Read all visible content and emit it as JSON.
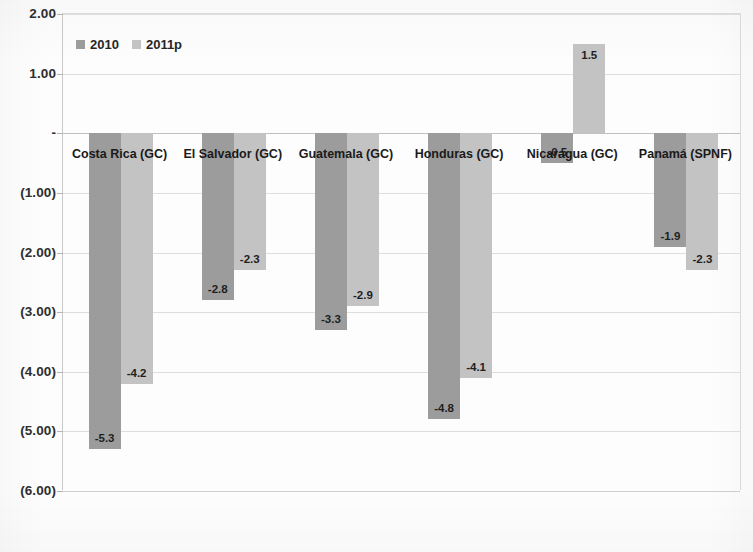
{
  "chart_data": {
    "type": "bar",
    "title": "",
    "subtitle": "",
    "xlabel": "",
    "ylabel": "",
    "categories": [
      "Costa Rica (GC)",
      "El Salvador (GC)",
      "Guatemala (GC)",
      "Honduras (GC)",
      "Nicaragua (GC)",
      "Panamá (SPNF)"
    ],
    "series": [
      {
        "name": "2010",
        "values": [
          -5.3,
          -2.8,
          -3.3,
          -4.8,
          -0.5,
          -1.9
        ]
      },
      {
        "name": "2011p",
        "values": [
          -4.2,
          -2.3,
          -2.9,
          -4.1,
          1.5,
          -2.3
        ]
      }
    ],
    "data_labels": [
      [
        "-5.3",
        "-4.2"
      ],
      [
        "-2.8",
        "-2.3"
      ],
      [
        "-3.3",
        "-2.9"
      ],
      [
        "-4.8",
        "-4.1"
      ],
      [
        "-0.5",
        "1.5"
      ],
      [
        "-1.9",
        "-2.3"
      ]
    ],
    "ylim": [
      -6.0,
      2.0
    ],
    "ytick_values": [
      2.0,
      1.0,
      0.0,
      -1.0,
      -2.0,
      -3.0,
      -4.0,
      -5.0,
      -6.0
    ],
    "ytick_labels": [
      "2.00",
      "1.00",
      "-",
      "(1.00)",
      "(2.00)",
      "(3.00)",
      "(4.00)",
      "(5.00)",
      "(6.00)"
    ],
    "grid": true,
    "legend_position": "top-left",
    "colors": {
      "series_2010": "#9c9c9c",
      "series_2011p": "#c3c3c3",
      "gridline": "#dedede",
      "axis": "#c0c0c0",
      "text": "#1f1f1f",
      "background": "#fdfdfd"
    }
  },
  "legend": {
    "items": [
      {
        "label": "2010",
        "color": "#9c9c9c"
      },
      {
        "label": "2011p",
        "color": "#c3c3c3"
      }
    ]
  }
}
